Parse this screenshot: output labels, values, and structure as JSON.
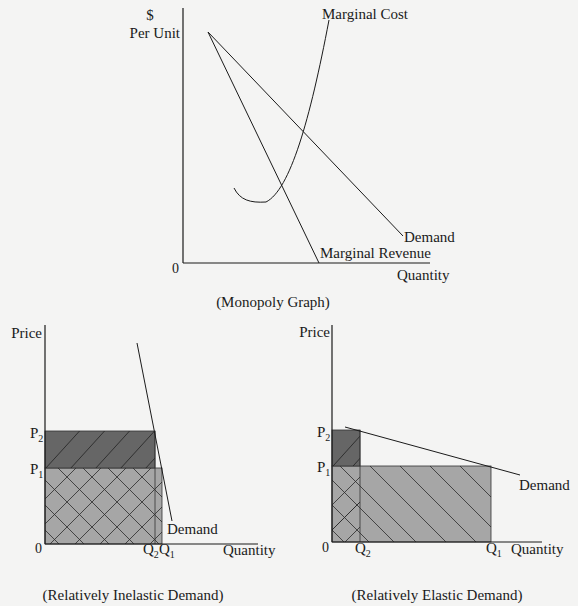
{
  "monopoly": {
    "caption": "(Monopoly Graph)",
    "y_label_top": "$",
    "y_label_bottom": "Per Unit",
    "x_label": "Quantity",
    "origin": "0",
    "curves": {
      "marginal_cost": "Marginal Cost",
      "demand": "Demand",
      "marginal_revenue": "Marginal Revenue"
    }
  },
  "inelastic": {
    "caption": "(Relatively Inelastic Demand)",
    "y_label": "Price",
    "x_label": "Quantity",
    "origin": "0",
    "p2": "P",
    "p2_sub": "2",
    "p1": "P",
    "p1_sub": "1",
    "q2": "Q",
    "q2_sub": "2",
    "q1": "Q",
    "q1_sub": "1",
    "demand": "Demand"
  },
  "elastic": {
    "caption": "(Relatively Elastic Demand)",
    "y_label": "Price",
    "x_label": "Quantity",
    "origin": "0",
    "p2": "P",
    "p2_sub": "2",
    "p1": "P",
    "p1_sub": "1",
    "q2": "Q",
    "q2_sub": "2",
    "q1": "Q",
    "q1_sub": "1",
    "demand": "Demand"
  },
  "colors": {
    "background": "#f4f4f3",
    "dark_fill": "#666666",
    "light_fill": "#a6a6a6",
    "line": "#1a1a1a"
  }
}
